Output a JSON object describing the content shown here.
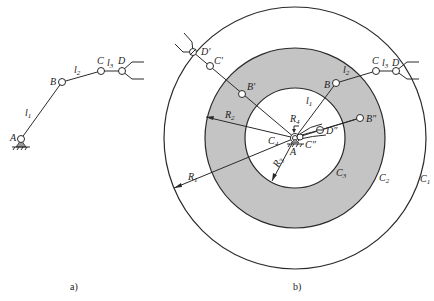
{
  "figure_a": {
    "caption": "a)",
    "joints": [
      {
        "id": "A",
        "label": "A"
      },
      {
        "id": "B",
        "label": "B"
      },
      {
        "id": "C",
        "label": "C"
      },
      {
        "id": "D",
        "label": "D"
      }
    ],
    "links": [
      {
        "id": "l1",
        "label": "l",
        "sub": "1"
      },
      {
        "id": "l2",
        "label": "l",
        "sub": "2"
      },
      {
        "id": "l3",
        "label": "l",
        "sub": "3"
      }
    ]
  },
  "figure_b": {
    "caption": "b)",
    "circles": [
      {
        "id": "C1",
        "label": "C",
        "sub": "1"
      },
      {
        "id": "C2",
        "label": "C",
        "sub": "2"
      },
      {
        "id": "C3",
        "label": "C",
        "sub": "3"
      },
      {
        "id": "C4",
        "label": "C",
        "sub": "4"
      }
    ],
    "radii": [
      {
        "id": "R1",
        "label": "R",
        "sub": "1"
      },
      {
        "id": "R2",
        "label": "R",
        "sub": "2"
      },
      {
        "id": "R3",
        "label": "R",
        "sub": "3"
      },
      {
        "id": "R4",
        "label": "R",
        "sub": "4"
      }
    ],
    "joints": {
      "A": "A",
      "B": "B",
      "C": "C",
      "D": "D",
      "B_prime": "B′",
      "C_prime": "C′",
      "D_prime": "D′",
      "B_dprime": "B″",
      "C_dprime": "C″",
      "D_dprime": "D″"
    },
    "links": {
      "l1": {
        "label": "l",
        "sub": "1"
      },
      "l2": {
        "label": "l",
        "sub": "2"
      },
      "l3": {
        "label": "l",
        "sub": "3"
      }
    },
    "shaded_region_color": "#c4c4c4"
  }
}
